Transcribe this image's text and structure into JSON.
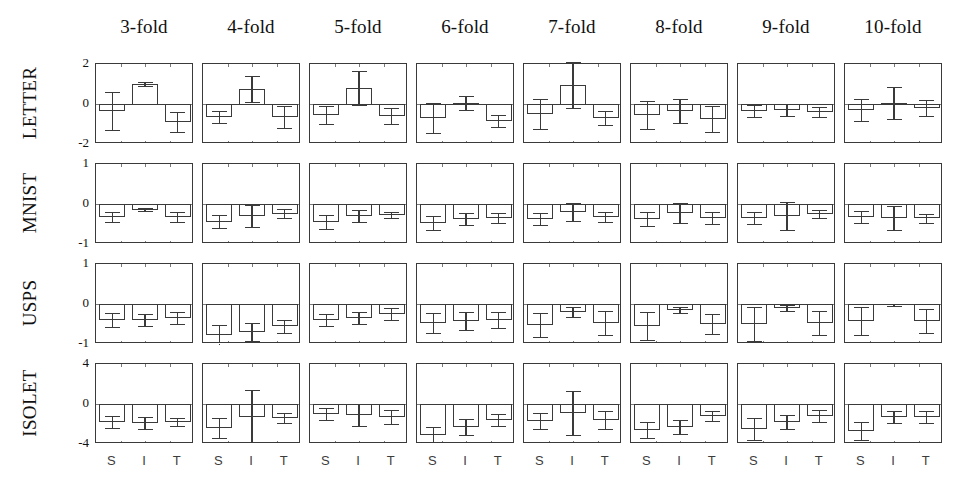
{
  "chart_data": {
    "type": "bar",
    "title": "",
    "subtitle": "",
    "xlabel": "",
    "ylabel": "",
    "grid": false,
    "legend": "none",
    "orientation": "small-multiples grid, 4 rows (datasets) x 8 columns (folds)",
    "column_headers": [
      "3-fold",
      "4-fold",
      "5-fold",
      "6-fold",
      "7-fold",
      "8-fold",
      "9-fold",
      "10-fold"
    ],
    "row_labels": [
      "LETTER",
      "MNIST",
      "USPS",
      "ISOLET"
    ],
    "x_categories": [
      "S",
      "I",
      "T"
    ],
    "row_axes": [
      {
        "name": "LETTER",
        "ylim": [
          -2,
          2
        ],
        "yticks": [
          2,
          0,
          -2
        ],
        "yticklabels": [
          "2",
          "0",
          "-2"
        ]
      },
      {
        "name": "MNIST",
        "ylim": [
          -1,
          1
        ],
        "yticks": [
          1,
          0,
          -1
        ],
        "yticklabels": [
          "1",
          "0",
          "-1"
        ]
      },
      {
        "name": "USPS",
        "ylim": [
          -1,
          1
        ],
        "yticks": [
          1,
          0,
          -1
        ],
        "yticklabels": [
          "1",
          "0",
          "-1"
        ]
      },
      {
        "name": "ISOLET",
        "ylim": [
          -4,
          4
        ],
        "yticks": [
          4,
          0,
          -4
        ],
        "yticklabels": [
          "4",
          "0",
          "-4"
        ]
      }
    ],
    "panels": [
      {
        "row": "LETTER",
        "col": "3-fold",
        "values": [
          -0.35,
          1.0,
          -0.9
        ],
        "errors": [
          0.95,
          0.1,
          0.5
        ]
      },
      {
        "row": "LETTER",
        "col": "4-fold",
        "values": [
          -0.65,
          0.75,
          -0.65
        ],
        "errors": [
          0.3,
          0.65,
          0.55
        ]
      },
      {
        "row": "LETTER",
        "col": "5-fold",
        "values": [
          -0.55,
          0.8,
          -0.6
        ],
        "errors": [
          0.45,
          0.85,
          0.4
        ]
      },
      {
        "row": "LETTER",
        "col": "6-fold",
        "values": [
          -0.7,
          0.03,
          -0.85
        ],
        "errors": [
          0.75,
          0.35,
          0.3
        ]
      },
      {
        "row": "LETTER",
        "col": "7-fold",
        "values": [
          -0.5,
          0.95,
          -0.7
        ],
        "errors": [
          0.75,
          1.15,
          0.35
        ]
      },
      {
        "row": "LETTER",
        "col": "8-fold",
        "values": [
          -0.55,
          -0.35,
          -0.75
        ],
        "errors": [
          0.7,
          0.6,
          0.65
        ]
      },
      {
        "row": "LETTER",
        "col": "9-fold",
        "values": [
          -0.35,
          -0.3,
          -0.4
        ],
        "errors": [
          0.3,
          0.3,
          0.25
        ]
      },
      {
        "row": "LETTER",
        "col": "10-fold",
        "values": [
          -0.3,
          0.05,
          -0.2
        ],
        "errors": [
          0.55,
          0.8,
          0.4
        ]
      },
      {
        "row": "MNIST",
        "col": "3-fold",
        "values": [
          -0.33,
          -0.14,
          -0.33
        ],
        "errors": [
          0.13,
          0.04,
          0.12
        ]
      },
      {
        "row": "MNIST",
        "col": "4-fold",
        "values": [
          -0.44,
          -0.3,
          -0.24
        ],
        "errors": [
          0.16,
          0.28,
          0.11
        ]
      },
      {
        "row": "MNIST",
        "col": "5-fold",
        "values": [
          -0.45,
          -0.3,
          -0.27
        ],
        "errors": [
          0.17,
          0.15,
          0.08
        ]
      },
      {
        "row": "MNIST",
        "col": "6-fold",
        "values": [
          -0.47,
          -0.38,
          -0.35
        ],
        "errors": [
          0.17,
          0.15,
          0.13
        ]
      },
      {
        "row": "MNIST",
        "col": "7-fold",
        "values": [
          -0.37,
          -0.2,
          -0.33
        ],
        "errors": [
          0.15,
          0.22,
          0.13
        ]
      },
      {
        "row": "MNIST",
        "col": "8-fold",
        "values": [
          -0.38,
          -0.22,
          -0.36
        ],
        "errors": [
          0.17,
          0.25,
          0.15
        ]
      },
      {
        "row": "MNIST",
        "col": "9-fold",
        "values": [
          -0.35,
          -0.3,
          -0.26
        ],
        "errors": [
          0.15,
          0.35,
          0.1
        ]
      },
      {
        "row": "MNIST",
        "col": "10-fold",
        "values": [
          -0.33,
          -0.35,
          -0.36
        ],
        "errors": [
          0.15,
          0.3,
          0.12
        ]
      },
      {
        "row": "USPS",
        "col": "3-fold",
        "values": [
          -0.4,
          -0.4,
          -0.36
        ],
        "errors": [
          0.17,
          0.15,
          0.15
        ]
      },
      {
        "row": "USPS",
        "col": "4-fold",
        "values": [
          -0.77,
          -0.7,
          -0.56
        ],
        "errors": [
          0.24,
          0.22,
          0.16
        ]
      },
      {
        "row": "USPS",
        "col": "5-fold",
        "values": [
          -0.4,
          -0.35,
          -0.25
        ],
        "errors": [
          0.15,
          0.15,
          0.15
        ]
      },
      {
        "row": "USPS",
        "col": "6-fold",
        "values": [
          -0.47,
          -0.42,
          -0.4
        ],
        "errors": [
          0.25,
          0.22,
          0.2
        ]
      },
      {
        "row": "USPS",
        "col": "7-fold",
        "values": [
          -0.53,
          -0.2,
          -0.48
        ],
        "errors": [
          0.3,
          0.12,
          0.3
        ]
      },
      {
        "row": "USPS",
        "col": "8-fold",
        "values": [
          -0.55,
          -0.15,
          -0.5
        ],
        "errors": [
          0.35,
          0.08,
          0.25
        ]
      },
      {
        "row": "USPS",
        "col": "9-fold",
        "values": [
          -0.5,
          -0.1,
          -0.47
        ],
        "errors": [
          0.42,
          0.07,
          0.3
        ]
      },
      {
        "row": "USPS",
        "col": "10-fold",
        "values": [
          -0.42,
          -0.02,
          -0.43
        ],
        "errors": [
          0.35,
          0.02,
          0.3
        ]
      },
      {
        "row": "ISOLET",
        "col": "3-fold",
        "values": [
          -1.8,
          -1.9,
          -1.8
        ],
        "errors": [
          0.6,
          0.6,
          0.4
        ]
      },
      {
        "row": "ISOLET",
        "col": "4-fold",
        "values": [
          -2.4,
          -1.3,
          -1.4
        ],
        "errors": [
          1.0,
          2.7,
          0.5
        ]
      },
      {
        "row": "ISOLET",
        "col": "5-fold",
        "values": [
          -1.0,
          -1.1,
          -1.3
        ],
        "errors": [
          0.6,
          1.1,
          0.7
        ]
      },
      {
        "row": "ISOLET",
        "col": "6-fold",
        "values": [
          -3.1,
          -2.3,
          -1.6
        ],
        "errors": [
          0.8,
          0.8,
          0.6
        ]
      },
      {
        "row": "ISOLET",
        "col": "7-fold",
        "values": [
          -1.7,
          -0.9,
          -1.6
        ],
        "errors": [
          0.8,
          2.2,
          0.9
        ]
      },
      {
        "row": "ISOLET",
        "col": "8-fold",
        "values": [
          -2.6,
          -2.3,
          -1.2
        ],
        "errors": [
          0.8,
          0.7,
          0.5
        ]
      },
      {
        "row": "ISOLET",
        "col": "9-fold",
        "values": [
          -2.5,
          -1.8,
          -1.2
        ],
        "errors": [
          1.1,
          0.7,
          0.6
        ]
      },
      {
        "row": "ISOLET",
        "col": "10-fold",
        "values": [
          -2.7,
          -1.3,
          -1.3
        ],
        "errors": [
          0.9,
          0.6,
          0.6
        ]
      }
    ]
  }
}
